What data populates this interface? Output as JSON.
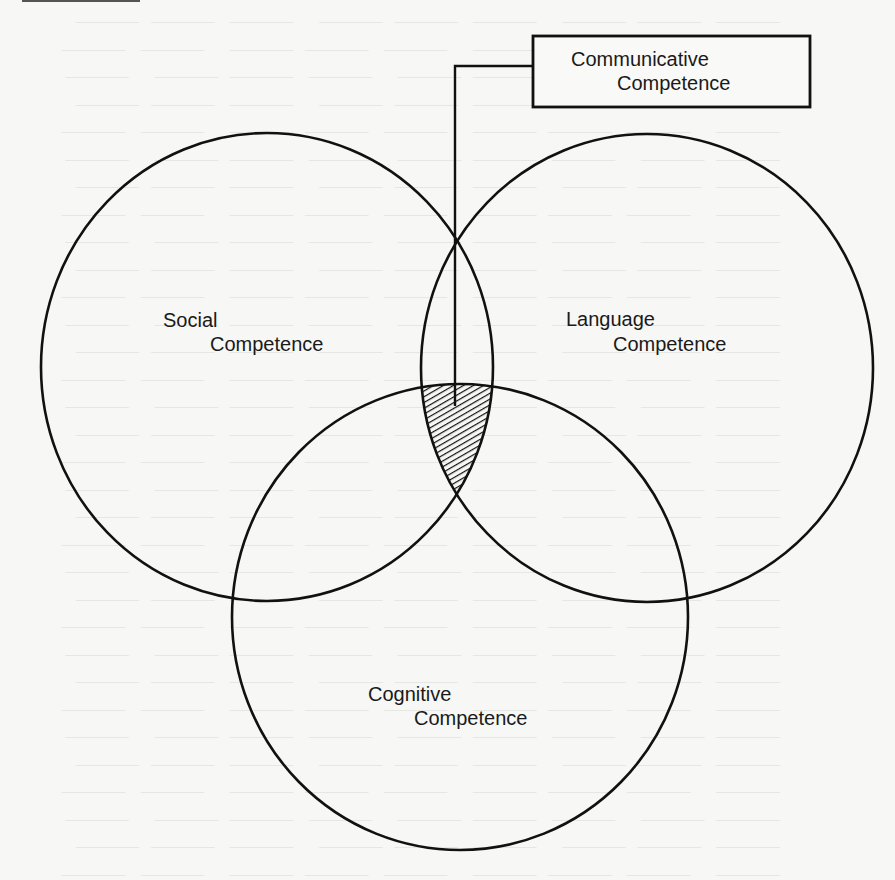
{
  "diagram": {
    "title_box": {
      "line1": "Communicative",
      "line2": "Competence"
    },
    "circles": [
      {
        "id": "social",
        "line1": "Social",
        "line2": "Competence"
      },
      {
        "id": "language",
        "line1": "Language",
        "line2": "Competence"
      },
      {
        "id": "cognitive",
        "line1": "Cognitive",
        "line2": "Competence"
      }
    ],
    "intersection": {
      "pattern": "diagonal-hatch",
      "meaning": "Communicative Competence"
    },
    "colors": {
      "ink": "#111111",
      "paper": "#f7f7f5"
    }
  }
}
